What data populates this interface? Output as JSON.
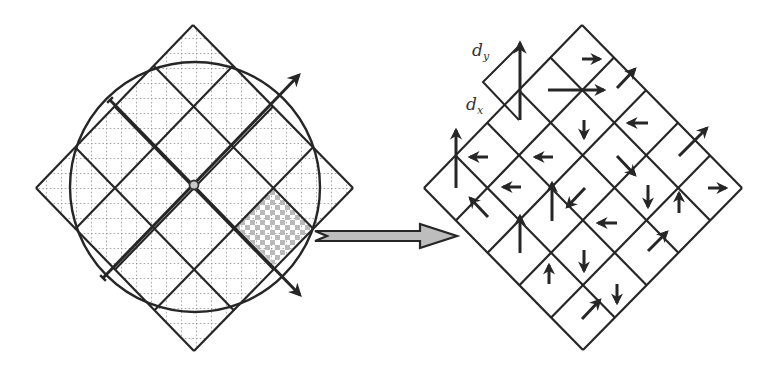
{
  "figure": {
    "colors": {
      "stroke": "#262626",
      "dotted_grid": "#8a8a8a",
      "checker": "#b9b9b9",
      "big_arrow_fill": "#bdbdbd",
      "center_dot_fill": "#c8c8c8"
    }
  },
  "left_panel": {
    "outer_diamond": {
      "top": [
        193,
        25
      ],
      "right": [
        353,
        188
      ],
      "bottom": [
        194,
        351
      ],
      "left": [
        36,
        188
      ]
    },
    "grid_cells": 4,
    "center": [
      194,
      185
    ],
    "circle": {
      "cx": 195,
      "cy": 187,
      "r": 125
    },
    "dotted_grid_spacing": 15,
    "axis_arrows": [
      {
        "name": "axis-arrow-up-right",
        "from": [
          103,
          278
        ],
        "to": [
          299,
          75
        ]
      },
      {
        "name": "axis-arrow-down-right",
        "from": [
          110,
          100
        ],
        "to": [
          300,
          295
        ]
      }
    ],
    "highlighted_cell": {
      "top": [
        274,
        188
      ],
      "right": [
        313,
        227
      ],
      "bottom": [
        274,
        265
      ],
      "left": [
        236,
        227
      ]
    }
  },
  "transfer_arrow": {
    "shaft_start_x": 315,
    "shaft_end_x": 420,
    "tip_x": 457,
    "center_y": 236,
    "shaft_half_height": 5,
    "head_half_height": 12
  },
  "right_panel": {
    "outer_diamond": {
      "top": [
        582,
        25
      ],
      "right": [
        742,
        188
      ],
      "bottom": [
        583,
        350
      ],
      "left": [
        424,
        188
      ]
    },
    "grid_cells": 5,
    "legend": {
      "dy_label": "d",
      "dy_sub": "y",
      "dx_label": "d",
      "dx_sub": "x",
      "triangle": {
        "left": [
          483,
          82
        ],
        "top": [
          519,
          46
        ],
        "bottom": [
          519,
          120
        ]
      },
      "arrow": {
        "from": [
          520,
          120
        ],
        "to": [
          520,
          43
        ]
      }
    },
    "arrows": [
      {
        "from": [
          582,
          59
        ],
        "to": [
          600,
          59
        ]
      },
      {
        "from": [
          548,
          90
        ],
        "to": [
          604,
          90
        ]
      },
      {
        "from": [
          617,
          88
        ],
        "to": [
          635,
          69
        ]
      },
      {
        "from": [
          584,
          120
        ],
        "to": [
          584,
          138
        ]
      },
      {
        "from": [
          648,
          123
        ],
        "to": [
          628,
          123
        ]
      },
      {
        "from": [
          679,
          156
        ],
        "to": [
          707,
          128
        ]
      },
      {
        "from": [
          456,
          188
        ],
        "to": [
          456,
          130
        ]
      },
      {
        "from": [
          488,
          157
        ],
        "to": [
          470,
          157
        ]
      },
      {
        "from": [
          553,
          157
        ],
        "to": [
          535,
          157
        ]
      },
      {
        "from": [
          617,
          156
        ],
        "to": [
          635,
          175
        ]
      },
      {
        "from": [
          521,
          187
        ],
        "to": [
          503,
          187
        ]
      },
      {
        "from": [
          552,
          221
        ],
        "to": [
          552,
          183
        ]
      },
      {
        "from": [
          585,
          188
        ],
        "to": [
          567,
          207
        ]
      },
      {
        "from": [
          648,
          185
        ],
        "to": [
          648,
          207
        ]
      },
      {
        "from": [
          708,
          188
        ],
        "to": [
          726,
          188
        ]
      },
      {
        "from": [
          488,
          217
        ],
        "to": [
          470,
          198
        ]
      },
      {
        "from": [
          520,
          253
        ],
        "to": [
          520,
          216
        ]
      },
      {
        "from": [
          679,
          213
        ],
        "to": [
          679,
          193
        ]
      },
      {
        "from": [
          617,
          223
        ],
        "to": [
          598,
          223
        ]
      },
      {
        "from": [
          648,
          251
        ],
        "to": [
          667,
          232
        ]
      },
      {
        "from": [
          549,
          284
        ],
        "to": [
          549,
          265
        ]
      },
      {
        "from": [
          584,
          250
        ],
        "to": [
          584,
          271
        ]
      },
      {
        "from": [
          617,
          284
        ],
        "to": [
          617,
          303
        ]
      },
      {
        "from": [
          582,
          319
        ],
        "to": [
          600,
          300
        ]
      }
    ]
  }
}
